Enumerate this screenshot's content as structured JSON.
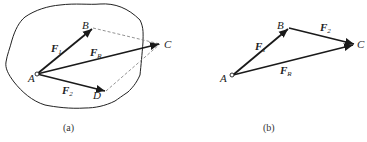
{
  "figure_a": {
    "caption": "(a)",
    "points": {
      "A": "A",
      "B": "B",
      "C": "C",
      "D": "D"
    },
    "vectors": {
      "F1": {
        "main": "F",
        "sub": "1"
      },
      "F2": {
        "main": "F",
        "sub": "2"
      },
      "FR": {
        "main": "F",
        "sub": "R"
      }
    }
  },
  "figure_b": {
    "caption": "(b)",
    "points": {
      "A": "A",
      "B": "B",
      "C": "C"
    },
    "vectors": {
      "F1": {
        "main": "F",
        "sub": "1"
      },
      "F2": {
        "main": "F",
        "sub": "2"
      },
      "FR": {
        "main": "F",
        "sub": "R"
      }
    }
  },
  "colors": {
    "line": "#1a1a1a",
    "dashed": "#777777",
    "outline": "#222222"
  }
}
